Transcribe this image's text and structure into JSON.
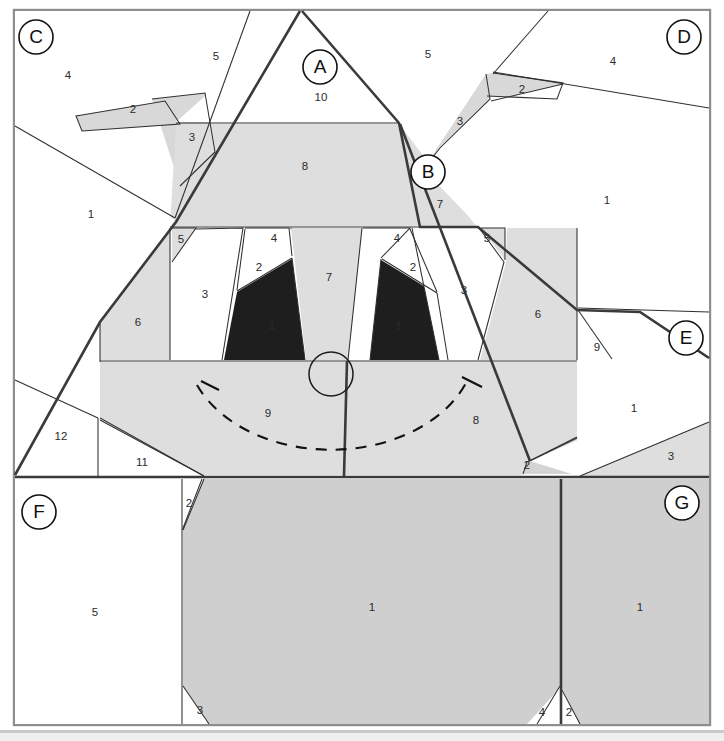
{
  "document": {
    "kind": "paper-piecing-pattern-diagram",
    "title": "Foundation Paper Piecing Pattern"
  },
  "palette": {
    "background": "#ffffff",
    "fabric_light": "#ffffff",
    "fabric_mid": "#dedede",
    "fabric_medium": "#cfcfcf",
    "fabric_dark": "#1e1e1e",
    "seam_line": "#2f2f2f",
    "major_seam_line": "#3a3a3a",
    "frame": "#8e8e8e",
    "label_text": "#2b2b2b",
    "letter_text": "#111111"
  },
  "sections": [
    {
      "id": "A",
      "label": "A",
      "cx": 320,
      "cy": 67
    },
    {
      "id": "B",
      "label": "B",
      "cx": 428,
      "cy": 172
    },
    {
      "id": "C",
      "label": "C",
      "cx": 36,
      "cy": 37
    },
    {
      "id": "D",
      "label": "D",
      "cx": 684,
      "cy": 37
    },
    {
      "id": "E",
      "label": "E",
      "cx": 686,
      "cy": 338
    },
    {
      "id": "F",
      "label": "F",
      "cx": 39,
      "cy": 512
    },
    {
      "id": "G",
      "label": "G",
      "cx": 682,
      "cy": 503
    }
  ],
  "pieces": [
    {
      "section": "A",
      "number": "10",
      "x": 321,
      "y": 98
    },
    {
      "section": "A",
      "number": "8",
      "x": 305,
      "y": 167
    },
    {
      "section": "A",
      "number": "5",
      "x": 181,
      "y": 240
    },
    {
      "section": "A",
      "number": "3",
      "x": 205,
      "y": 295
    },
    {
      "section": "A",
      "number": "4",
      "x": 274,
      "y": 239
    },
    {
      "section": "A",
      "number": "2",
      "x": 259,
      "y": 268
    },
    {
      "section": "A",
      "number": "1",
      "x": 272,
      "y": 326
    },
    {
      "section": "A",
      "number": "7",
      "x": 329,
      "y": 278
    },
    {
      "section": "A",
      "number": "6",
      "x": 138,
      "y": 323
    },
    {
      "section": "A",
      "number": "9",
      "x": 268,
      "y": 414
    },
    {
      "section": "B",
      "number": "7",
      "x": 440,
      "y": 205
    },
    {
      "section": "B",
      "number": "4",
      "x": 397,
      "y": 239
    },
    {
      "section": "B",
      "number": "2",
      "x": 413,
      "y": 268
    },
    {
      "section": "B",
      "number": "1",
      "x": 399,
      "y": 327
    },
    {
      "section": "B",
      "number": "3",
      "x": 464,
      "y": 291
    },
    {
      "section": "B",
      "number": "5",
      "x": 487,
      "y": 239
    },
    {
      "section": "B",
      "number": "6",
      "x": 538,
      "y": 315
    },
    {
      "section": "B",
      "number": "9",
      "x": 597,
      "y": 348
    },
    {
      "section": "B",
      "number": "8",
      "x": 476,
      "y": 421
    },
    {
      "section": "B",
      "number": "2b",
      "x": 527,
      "y": 466
    },
    {
      "section": "C",
      "number": "4",
      "x": 68,
      "y": 76
    },
    {
      "section": "C",
      "number": "5",
      "x": 216,
      "y": 57
    },
    {
      "section": "C",
      "number": "2",
      "x": 133,
      "y": 110
    },
    {
      "section": "C",
      "number": "3",
      "x": 192,
      "y": 138
    },
    {
      "section": "C",
      "number": "1",
      "x": 91,
      "y": 215
    },
    {
      "section": "C",
      "number": "12",
      "x": 61,
      "y": 437
    },
    {
      "section": "C",
      "number": "11",
      "x": 142,
      "y": 463
    },
    {
      "section": "D",
      "number": "5",
      "x": 428,
      "y": 55
    },
    {
      "section": "D",
      "number": "4",
      "x": 613,
      "y": 62
    },
    {
      "section": "D",
      "number": "2",
      "x": 522,
      "y": 90
    },
    {
      "section": "D",
      "number": "3",
      "x": 460,
      "y": 122
    },
    {
      "section": "D",
      "number": "1",
      "x": 607,
      "y": 201
    },
    {
      "section": "E",
      "number": "1",
      "x": 634,
      "y": 409
    },
    {
      "section": "E",
      "number": "3",
      "x": 671,
      "y": 457
    },
    {
      "section": "F",
      "number": "5",
      "x": 95,
      "y": 613
    },
    {
      "section": "F",
      "number": "2",
      "x": 189,
      "y": 504
    },
    {
      "section": "F",
      "number": "3",
      "x": 200,
      "y": 711
    },
    {
      "section": "F",
      "number": "1",
      "x": 372,
      "y": 608
    },
    {
      "section": "G",
      "number": "1",
      "x": 640,
      "y": 608
    },
    {
      "section": "G",
      "number": "4",
      "x": 542,
      "y": 713
    },
    {
      "section": "G",
      "number": "2",
      "x": 569,
      "y": 713
    }
  ],
  "markings": {
    "nose_circle": {
      "cx": 331,
      "cy": 374,
      "r": 22
    },
    "mouth_arc_label_left": "9",
    "mouth_arc_label_right": "8"
  }
}
